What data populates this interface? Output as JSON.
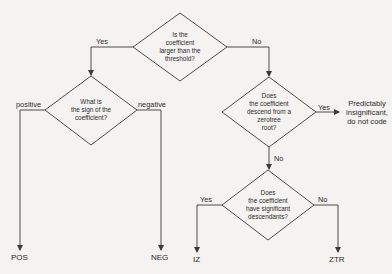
{
  "diagram": {
    "type": "decision-flowchart",
    "nodes": {
      "d1": {
        "text": "Is the\ncoefficient\nlarger than the\nthreshold?"
      },
      "d2": {
        "text": "What is\nthe sign of the\ncoefficient?"
      },
      "d3": {
        "text": "Does\nthe coefficient\ndescend from a\nzerotree\nroot?"
      },
      "d4": {
        "text": "Does\nthe coefficient\nhave significant\ndescendants?"
      },
      "pos": {
        "text": "POS"
      },
      "neg": {
        "text": "NEG"
      },
      "iz": {
        "text": "IZ"
      },
      "ztr": {
        "text": "ZTR"
      },
      "insig": {
        "text": "Predictably\ninsignificant,\ndo not code"
      }
    },
    "edges": {
      "d1_yes": {
        "label": "Yes"
      },
      "d1_no": {
        "label": "No"
      },
      "d2_pos": {
        "label": "positive"
      },
      "d2_neg": {
        "label": "negative"
      },
      "d3_yes": {
        "label": "Yes"
      },
      "d3_no": {
        "label": "No"
      },
      "d4_yes": {
        "label": "Yes"
      },
      "d4_no": {
        "label": "No"
      }
    },
    "colors": {
      "line": "#3a3a3a",
      "background": "#f4f3f1",
      "text": "#2a2a2a"
    }
  }
}
